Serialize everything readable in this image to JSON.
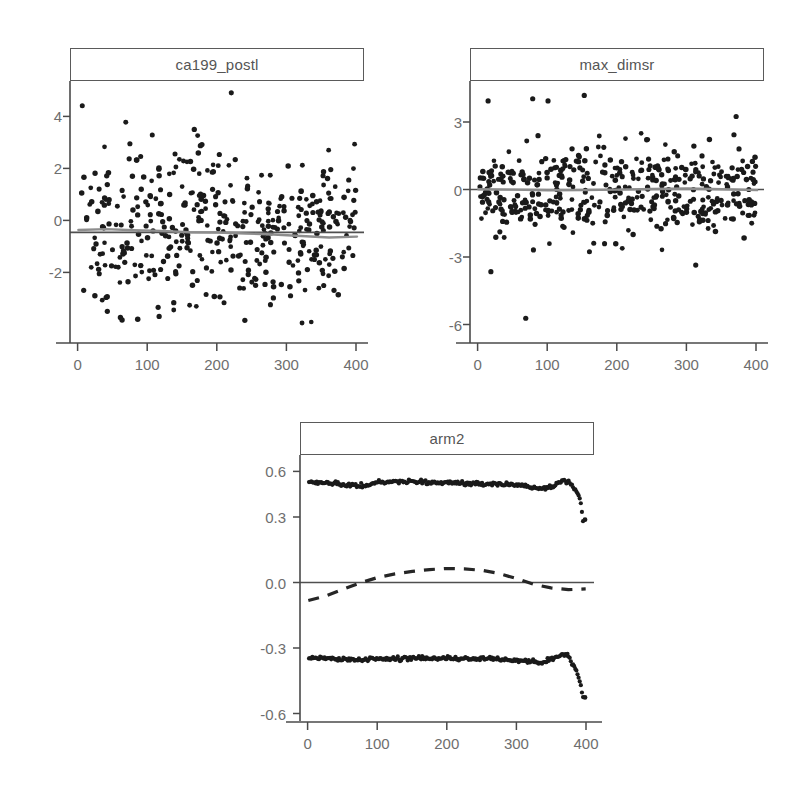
{
  "figure": {
    "background": "#ffffff",
    "point_color": "#1a1a1a",
    "trend_color": "#8d8d8d",
    "axis_color": "#4a4a4a",
    "label_color": "#6e6e6e"
  },
  "panels": [
    {
      "id": "panel-ca199-postl",
      "title": "ca199_postl",
      "x_ticks": [
        "0",
        "100",
        "200",
        "300",
        "400"
      ],
      "y_ticks": [
        "4",
        "2",
        "0",
        "-2"
      ]
    },
    {
      "id": "panel-max-dimsr",
      "title": "max_dimsr",
      "x_ticks": [
        "0",
        "100",
        "200",
        "300",
        "400"
      ],
      "y_ticks": [
        "3",
        "0",
        "-3",
        "-6"
      ]
    },
    {
      "id": "panel-arm2",
      "title": "arm2",
      "x_ticks": [
        "0",
        "100",
        "200",
        "300",
        "400"
      ],
      "y_ticks": [
        "0.6",
        "0.3",
        "0.0",
        "-0.3",
        "-0.6"
      ]
    }
  ],
  "chart_data": [
    {
      "type": "scatter",
      "id": "ca199_postl",
      "title": "ca199_postl",
      "xlabel": "",
      "ylabel": "",
      "xlim": [
        -12,
        410
      ],
      "ylim": [
        -3.6,
        5.3
      ],
      "xticks": [
        0,
        100,
        200,
        300,
        400
      ],
      "yticks": [
        4,
        2,
        0,
        -2
      ],
      "grid": false,
      "legend": "none",
      "n_points": 430,
      "description": "Martingale-type residual scatter vs observation index; dense cloud centred near 0 with vertical spread shrinking slightly at high index; a horizontal reference line at y=0 and a grey smoothed trend line hugging y=0.",
      "series": [
        {
          "name": "residuals",
          "marker": "filled-circle",
          "color": "#1a1a1a",
          "x_range": [
            2,
            398
          ],
          "y_spread": {
            "sd_left": 1.65,
            "sd_right": 1.05,
            "mean": 0.05
          },
          "y_min": -3.2,
          "y_max": 4.95
        },
        {
          "name": "zero-reference-line",
          "type": "hline",
          "y": 0,
          "color": "#4f4f4f"
        },
        {
          "name": "smoothed-trend",
          "type": "line",
          "color": "#8d8d8d",
          "x": [
            0,
            40,
            80,
            120,
            160,
            200,
            240,
            280,
            320,
            360,
            400
          ],
          "y": [
            0.1,
            0.13,
            0.09,
            0.07,
            0.02,
            0.01,
            -0.02,
            -0.06,
            -0.11,
            -0.16,
            -0.13
          ]
        }
      ]
    },
    {
      "type": "scatter",
      "id": "max_dimsr",
      "title": "max_dimsr",
      "xlabel": "",
      "ylabel": "",
      "xlim": [
        -12,
        410
      ],
      "ylim": [
        -6.6,
        4.9
      ],
      "xticks": [
        0,
        100,
        200,
        300,
        400
      ],
      "yticks": [
        3,
        0,
        -3,
        -6
      ],
      "grid": false,
      "legend": "none",
      "n_points": 450,
      "description": "Residual scatter vs observation index; tight band between about -1.5 and +1.5 with occasional outliers up to +4.2 and down to -5.8; horizontal reference line at y=0 plus grey smooth trend near 0.",
      "series": [
        {
          "name": "residuals",
          "marker": "filled-circle",
          "color": "#1a1a1a",
          "x_range": [
            2,
            398
          ],
          "y_spread": {
            "sd_left": 1.05,
            "sd_right": 1.05,
            "mean": 0.0
          },
          "y_min": -5.8,
          "y_max": 4.2,
          "outliers": [
            {
              "x": 14,
              "y": 4.0
            },
            {
              "x": 78,
              "y": 4.1
            },
            {
              "x": 100,
              "y": 4.0
            },
            {
              "x": 152,
              "y": 4.25
            },
            {
              "x": 370,
              "y": 3.3
            },
            {
              "x": 18,
              "y": -3.7
            },
            {
              "x": 312,
              "y": -3.4
            },
            {
              "x": 68,
              "y": -5.8
            }
          ]
        },
        {
          "name": "zero-reference-line",
          "type": "hline",
          "y": 0,
          "color": "#4f4f4f"
        },
        {
          "name": "smoothed-trend",
          "type": "line",
          "color": "#8d8d8d",
          "x": [
            0,
            50,
            100,
            150,
            200,
            250,
            300,
            350,
            400
          ],
          "y": [
            0.02,
            0.0,
            -0.03,
            -0.02,
            0.0,
            0.03,
            0.05,
            0.02,
            -0.02
          ]
        }
      ]
    },
    {
      "type": "line",
      "id": "arm2",
      "title": "arm2",
      "xlabel": "",
      "ylabel": "",
      "xlim": [
        -12,
        412
      ],
      "ylim": [
        -0.72,
        0.7
      ],
      "xticks": [
        0,
        100,
        200,
        300,
        400
      ],
      "yticks": [
        0.6,
        0.3,
        0.0,
        -0.3,
        -0.6
      ],
      "grid": false,
      "legend": "none",
      "description": "Score-process / martingale residual plot for covariate arm2: an upper and a lower near-flat dotted band (roughly +0.55 and -0.44) that diverge sharply near index 390, a solid horizontal reference line at 0, and a dashed smoothed curve that starts at about -0.11, crosses zero near index 80, peaks around +0.07 near index 210 and falls back to about -0.05 by index 400.",
      "series": [
        {
          "name": "upper-band",
          "marker": "filled-circle",
          "color": "#1c1c1c",
          "x": [
            0,
            20,
            40,
            60,
            80,
            100,
            120,
            140,
            160,
            180,
            200,
            220,
            240,
            260,
            280,
            300,
            320,
            340,
            355,
            365,
            375,
            382,
            388,
            392,
            396
          ],
          "y": [
            0.548,
            0.545,
            0.54,
            0.532,
            0.53,
            0.545,
            0.552,
            0.552,
            0.548,
            0.545,
            0.545,
            0.544,
            0.54,
            0.538,
            0.54,
            0.536,
            0.52,
            0.516,
            0.53,
            0.556,
            0.552,
            0.52,
            0.486,
            0.462,
            0.34
          ]
        },
        {
          "name": "lower-band",
          "marker": "filled-circle",
          "color": "#1c1c1c",
          "x": [
            0,
            20,
            40,
            60,
            80,
            100,
            120,
            140,
            160,
            180,
            200,
            220,
            240,
            260,
            280,
            300,
            320,
            340,
            355,
            365,
            375,
            382,
            388,
            392,
            396
          ],
          "y": [
            -0.432,
            -0.43,
            -0.436,
            -0.444,
            -0.444,
            -0.432,
            -0.432,
            -0.434,
            -0.428,
            -0.432,
            -0.43,
            -0.434,
            -0.438,
            -0.438,
            -0.44,
            -0.444,
            -0.45,
            -0.456,
            -0.43,
            -0.408,
            -0.42,
            -0.47,
            -0.52,
            -0.566,
            -0.65
          ]
        },
        {
          "name": "zero-reference-line",
          "type": "hline",
          "y": 0,
          "color": "#4f4f4f"
        },
        {
          "name": "smoothed-score-process",
          "type": "dashed-line",
          "color": "#262626",
          "x": [
            0,
            25,
            50,
            75,
            100,
            125,
            150,
            175,
            200,
            225,
            250,
            275,
            300,
            325,
            350,
            375,
            400
          ],
          "y": [
            -0.11,
            -0.085,
            -0.048,
            -0.012,
            0.018,
            0.038,
            0.052,
            0.062,
            0.068,
            0.066,
            0.058,
            0.04,
            0.012,
            -0.02,
            -0.04,
            -0.05,
            -0.046
          ]
        }
      ]
    }
  ]
}
